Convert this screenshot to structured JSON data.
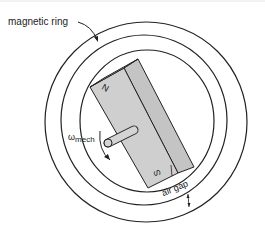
{
  "diagram": {
    "labels": {
      "magnetic_ring": "magnetic ring",
      "omega": "ω",
      "omega_sub": "mech",
      "north": "N",
      "south": "S",
      "air_gap": "air gap"
    },
    "colors": {
      "stroke": "#222222",
      "magnet_front": "#cfcfcf",
      "magnet_side": "#c4c4c4",
      "background": "#ffffff"
    }
  }
}
